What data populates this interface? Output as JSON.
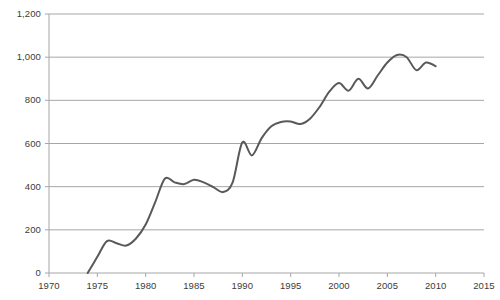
{
  "chart_data": {
    "type": "line",
    "title": "",
    "subtitle": "",
    "xlabel": "",
    "ylabel": "",
    "xlim": [
      1970,
      2015
    ],
    "ylim": [
      0,
      1200
    ],
    "xticks": [
      "1970",
      "1975",
      "1980",
      "1985",
      "1990",
      "1995",
      "2000",
      "2005",
      "2010",
      "2015"
    ],
    "yticks": [
      "0",
      "200",
      "400",
      "600",
      "800",
      "1,000",
      "1,200"
    ],
    "grid": "horizontal",
    "legend": "none",
    "series": [
      {
        "name": "series-1",
        "color": "#595959",
        "x": [
          1974,
          1975,
          1976,
          1977,
          1978,
          1979,
          1980,
          1981,
          1982,
          1983,
          1984,
          1985,
          1986,
          1987,
          1988,
          1989,
          1990,
          1991,
          1992,
          1993,
          1994,
          1995,
          1996,
          1997,
          1998,
          1999,
          2000,
          2001,
          2002,
          2003,
          2004,
          2005,
          2006,
          2007,
          2008,
          2009,
          2010
        ],
        "values": [
          0,
          75,
          148,
          138,
          127,
          160,
          225,
          330,
          438,
          420,
          412,
          432,
          420,
          398,
          375,
          420,
          605,
          545,
          625,
          680,
          700,
          702,
          690,
          715,
          770,
          840,
          880,
          845,
          900,
          855,
          915,
          975,
          1010,
          1000,
          940,
          975,
          958
        ]
      }
    ]
  },
  "axis": {
    "y_gridline_values": [
      0,
      200,
      400,
      600,
      800,
      1000,
      1200
    ],
    "x_tick_values": [
      1970,
      1975,
      1980,
      1985,
      1990,
      1995,
      2000,
      2005,
      2010,
      2015
    ]
  },
  "colors": {
    "line": "#595959",
    "gridline": "#a6a6a6",
    "axis": "#a6a6a6",
    "text": "#3b3b3b",
    "background": "#ffffff"
  }
}
